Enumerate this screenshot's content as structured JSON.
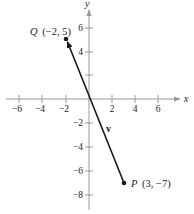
{
  "diagram": {
    "type": "coordinate-plane-vector",
    "x_axis": {
      "label": "x",
      "ticks": [
        -6,
        -4,
        -2,
        2,
        4,
        6
      ],
      "tick_labels": [
        "−6",
        "−4",
        "−2",
        "2",
        "4",
        "6"
      ]
    },
    "y_axis": {
      "label": "y",
      "ticks": [
        6,
        4,
        2,
        -2,
        -4,
        -6,
        -8
      ],
      "tick_labels": [
        "6",
        "4",
        "",
        "−2",
        "−4",
        "−6",
        "−8"
      ]
    },
    "points": [
      {
        "name": "Q",
        "coords": "(−2, 5)",
        "x": -2,
        "y": 5
      },
      {
        "name": "P",
        "coords": "(3, −7)",
        "x": 3,
        "y": -7
      }
    ],
    "vector": {
      "label": "v",
      "from": "P",
      "to": "Q",
      "color": "#1a1a1a"
    },
    "colors": {
      "axis": "#9a9a9a",
      "text": "#222222",
      "vector": "#1a1a1a"
    }
  }
}
